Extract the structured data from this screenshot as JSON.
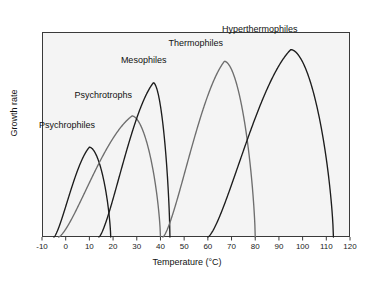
{
  "figure": {
    "background_color": "#ffffff",
    "plot_background_color": "#f4f4f4",
    "frame_color": "#3a3a3a"
  },
  "chart_data": {
    "type": "line",
    "title": "",
    "xlabel": "Temperature (°C)",
    "ylabel": "Growth rate",
    "xlim": [
      -10,
      120
    ],
    "ylim": [
      0,
      1.05
    ],
    "grid": false,
    "legend_position": "inline-annotations",
    "xticks": [
      -10,
      0,
      10,
      20,
      30,
      40,
      50,
      60,
      70,
      80,
      90,
      100,
      110,
      120
    ],
    "xtick_labels": [
      "-10",
      "0",
      "10",
      "20",
      "30",
      "40",
      "50",
      "60",
      "70",
      "80",
      "90",
      "100",
      "110",
      "120"
    ],
    "yticks": [],
    "ytick_labels": [],
    "series": [
      {
        "name": "Psychrophiles",
        "color": "#1c1c1c",
        "min_temp": -5,
        "opt_temp": 10,
        "max_temp": 19,
        "peak_height": 0.46,
        "label": "Psychrophiles",
        "label_x": 0.5,
        "label_y": 0.57
      },
      {
        "name": "Psychrotrophs",
        "color": "#6e6e6e",
        "min_temp": -3,
        "opt_temp": 28,
        "max_temp": 40,
        "peak_height": 0.62,
        "label": "Psychrotrophs",
        "label_x": 16,
        "label_y": 0.72
      },
      {
        "name": "Mesophiles",
        "color": "#1c1c1c",
        "min_temp": 14,
        "opt_temp": 37,
        "max_temp": 44,
        "peak_height": 0.79,
        "label": "Mesophiles",
        "label_x": 33,
        "label_y": 0.9
      },
      {
        "name": "Thermophiles",
        "color": "#6e6e6e",
        "min_temp": 41,
        "opt_temp": 67,
        "max_temp": 80,
        "peak_height": 0.9,
        "label": "Thermophiles",
        "label_x": 55,
        "label_y": 0.99
      },
      {
        "name": "Hyperthermophiles",
        "color": "#1c1c1c",
        "min_temp": 60,
        "opt_temp": 95,
        "max_temp": 113,
        "peak_height": 0.96,
        "label": "Hyperthermophiles",
        "label_x": 82,
        "label_y": 1.06
      }
    ]
  }
}
